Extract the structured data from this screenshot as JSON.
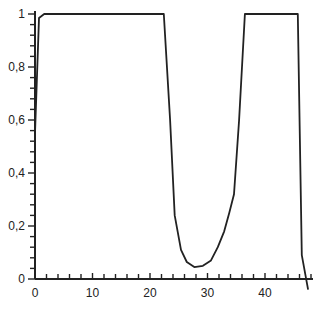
{
  "chart_data": {
    "type": "line",
    "title": "",
    "xlabel": "",
    "ylabel": "",
    "xlim": [
      0,
      48
    ],
    "ylim": [
      0,
      1
    ],
    "grid": false,
    "legend": null,
    "x_ticks": [
      0,
      10,
      20,
      30,
      40
    ],
    "x_tick_labels": [
      "0",
      "10",
      "20",
      "30",
      "40"
    ],
    "x_minor_step": 2,
    "y_ticks": [
      0,
      0.2,
      0.4,
      0.6,
      0.8,
      1
    ],
    "y_tick_labels": [
      "0",
      "0,2",
      "0,4",
      "0,6",
      "0,8",
      "1"
    ],
    "y_minor_step": 0.04,
    "series": [
      {
        "name": "series-1",
        "color": "#222222",
        "x": [
          0,
          0.7,
          1.6,
          22.4,
          23.5,
          24.3,
          25.4,
          26.4,
          27.7,
          29.2,
          30.6,
          31.8,
          32.9,
          33.8,
          34.6,
          35.5,
          36.5,
          45.7,
          46.4,
          47.5
        ],
        "y": [
          0.55,
          0.985,
          1.0,
          1.0,
          0.6,
          0.24,
          0.11,
          0.064,
          0.045,
          0.05,
          0.07,
          0.12,
          0.18,
          0.25,
          0.32,
          0.6,
          1.0,
          1.0,
          0.09,
          -0.04
        ]
      }
    ]
  }
}
